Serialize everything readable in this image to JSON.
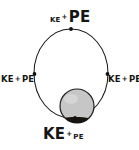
{
  "diagram": {
    "background_color": "#ffffff",
    "ink_color": "#151515",
    "orbit": {
      "shape": "ellipse",
      "center_x": 71,
      "center_y": 73.5,
      "radius_x": 37,
      "radius_y": 44.5,
      "stroke_color": "#1a1a1a",
      "stroke_width": 1
    },
    "planet": {
      "label": "planet",
      "center_x": 77,
      "center_y": 106,
      "radius": 17,
      "fill_color": "#c6c6c6",
      "stroke_color": "#1f1f1f",
      "shadow_color": "#17140f"
    },
    "markers": [
      {
        "name": "apoapsis-marker",
        "x": 71,
        "y": 29
      },
      {
        "name": "left-marker",
        "x": 34.5,
        "y": 74
      },
      {
        "name": "right-marker",
        "x": 107.5,
        "y": 74
      },
      {
        "name": "periapsis-marker",
        "x": 75,
        "y": 118
      }
    ],
    "labels": [
      {
        "name": "apoapsis",
        "position": "top",
        "ke_text": "KE",
        "ke_size": "small",
        "plus_text": "+",
        "pe_text": "PE",
        "pe_size": "large",
        "meaning": "low kinetic energy, high potential energy"
      },
      {
        "name": "left",
        "position": "left",
        "ke_text": "KE",
        "ke_size": "medium",
        "plus_text": "+",
        "pe_text": "PE",
        "pe_size": "medium",
        "meaning": "kinetic and potential energy roughly equal"
      },
      {
        "name": "right",
        "position": "right",
        "ke_text": "KE",
        "ke_size": "medium",
        "plus_text": "+",
        "pe_text": "PE",
        "pe_size": "medium",
        "meaning": "kinetic and potential energy roughly equal"
      },
      {
        "name": "periapsis",
        "position": "bottom",
        "ke_text": "KE",
        "ke_size": "large",
        "plus_text": "+",
        "pe_text": "PE",
        "pe_size": "small",
        "meaning": "high kinetic energy, low potential energy"
      }
    ]
  }
}
